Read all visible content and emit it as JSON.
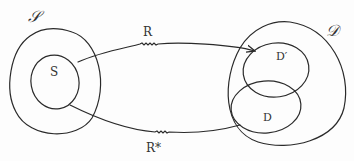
{
  "diagram": {
    "type": "set-mapping",
    "sets": {
      "source_universe": {
        "label": "𝒮"
      },
      "source_subset": {
        "label": "S"
      },
      "target_universe": {
        "label": "𝒟"
      },
      "target_subset_prime": {
        "label": "D′"
      },
      "target_subset": {
        "label": "D"
      }
    },
    "mappings": [
      {
        "id": "R",
        "label": "R",
        "from": "S",
        "to": "D′"
      },
      {
        "id": "R_star",
        "label": "R*",
        "from": "S",
        "to": "D"
      }
    ],
    "colors": {
      "ink": "#2a2a2a",
      "paper": "#fdfdfd"
    }
  }
}
